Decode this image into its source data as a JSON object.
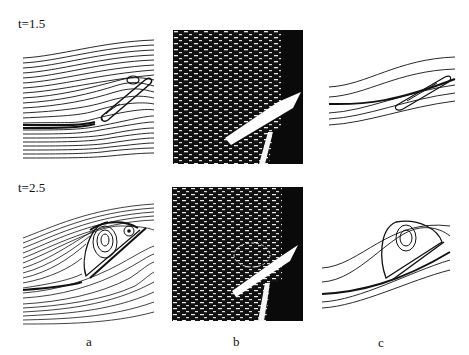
{
  "figure": {
    "rows": [
      {
        "time_label": "t=1.5"
      },
      {
        "time_label": "t=2.5"
      }
    ],
    "columns": [
      {
        "label": "a",
        "description": "numerical streamlines"
      },
      {
        "label": "b",
        "description": "flow visualization photograph"
      },
      {
        "label": "c",
        "description": "numerical streamlines (sparse)"
      }
    ]
  },
  "colors": {
    "ink": "#111111",
    "background": "#ffffff"
  }
}
